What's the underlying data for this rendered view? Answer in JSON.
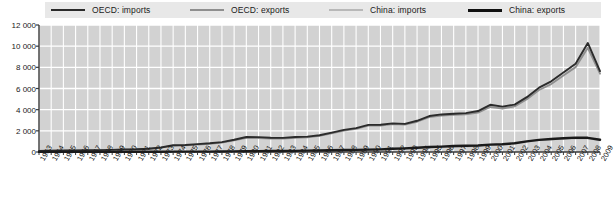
{
  "legend": {
    "position": "top",
    "items": [
      {
        "label": "OECD: imports",
        "color": "#2b2b2b",
        "width": 1.9,
        "icon": "line-swatch"
      },
      {
        "label": "OECD: exports",
        "color": "#8f8f8f",
        "width": 1.9,
        "icon": "line-swatch"
      },
      {
        "label": "China: imports",
        "color": "#b0b0b0",
        "width": 1.6,
        "icon": "line-swatch"
      },
      {
        "label": "China: exports",
        "color": "#1a1a1a",
        "width": 2.4,
        "icon": "line-swatch"
      }
    ]
  },
  "axes": {
    "y_ticks": [
      "0",
      "2 000",
      "4 000",
      "6 000",
      "8 000",
      "10 000",
      "12 000"
    ],
    "y_values": [
      0,
      2000,
      4000,
      6000,
      8000,
      10000,
      12000
    ],
    "x_ticks": [
      "1963",
      "1964",
      "1965",
      "1966",
      "1967",
      "1968",
      "1969",
      "1970",
      "1971",
      "1972",
      "1973",
      "1974",
      "1975",
      "1976",
      "1977",
      "1978",
      "1979",
      "1980",
      "1981",
      "1982",
      "1983",
      "1984",
      "1985",
      "1986",
      "1987",
      "1988",
      "1989",
      "1990",
      "1991",
      "1992",
      "1993",
      "1994",
      "1995",
      "1996",
      "1997",
      "1998",
      "1999",
      "2000",
      "2001",
      "2002",
      "2003",
      "2004",
      "2005",
      "2006",
      "2007",
      "2008",
      "2009"
    ]
  },
  "colors": {
    "plot_background": "#d2d2d2",
    "gridline": "#ffffff",
    "axis_line": "#3a3a3a",
    "legend_background": "#e8e8e8",
    "page_background": "#ffffff",
    "text": "#1a1a1a"
  },
  "chart_data": {
    "type": "line",
    "title": "",
    "subtitle": "",
    "xlabel": "",
    "ylabel": "",
    "xlim": [
      1963,
      2009
    ],
    "ylim": [
      0,
      12000
    ],
    "grid": true,
    "legend_position": "top",
    "x": [
      1963,
      1964,
      1965,
      1966,
      1967,
      1968,
      1969,
      1970,
      1971,
      1972,
      1973,
      1974,
      1975,
      1976,
      1977,
      1978,
      1979,
      1980,
      1981,
      1982,
      1983,
      1984,
      1985,
      1986,
      1987,
      1988,
      1989,
      1990,
      1991,
      1992,
      1993,
      1994,
      1995,
      1996,
      1997,
      1998,
      1999,
      2000,
      2001,
      2002,
      2003,
      2004,
      2005,
      2006,
      2007,
      2008,
      2009
    ],
    "series": [
      {
        "name": "OECD: imports",
        "color": "#2b2b2b",
        "values": [
          110,
          120,
          135,
          150,
          160,
          180,
          205,
          235,
          260,
          310,
          430,
          640,
          660,
          740,
          820,
          930,
          1160,
          1420,
          1410,
          1340,
          1330,
          1420,
          1450,
          1580,
          1830,
          2090,
          2260,
          2560,
          2570,
          2700,
          2660,
          2950,
          3400,
          3550,
          3620,
          3670,
          3870,
          4460,
          4290,
          4480,
          5180,
          6080,
          6680,
          7520,
          8340,
          10300,
          7650
        ]
      },
      {
        "name": "OECD: exports",
        "color": "#8f8f8f",
        "values": [
          105,
          115,
          130,
          145,
          155,
          175,
          200,
          228,
          252,
          300,
          415,
          600,
          630,
          700,
          780,
          890,
          1100,
          1330,
          1320,
          1270,
          1260,
          1330,
          1380,
          1520,
          1760,
          2020,
          2190,
          2490,
          2500,
          2630,
          2590,
          2860,
          3300,
          3450,
          3510,
          3560,
          3730,
          4260,
          4110,
          4310,
          4990,
          5860,
          6420,
          7230,
          8020,
          9840,
          7400
        ]
      },
      {
        "name": "China: imports",
        "color": "#b0b0b0",
        "values": [
          12,
          13,
          14,
          15,
          16,
          16,
          17,
          19,
          20,
          22,
          31,
          41,
          42,
          44,
          45,
          54,
          78,
          95,
          102,
          110,
          115,
          150,
          295,
          300,
          310,
          380,
          400,
          390,
          420,
          510,
          610,
          810,
          950,
          1020,
          1080,
          1100,
          1300,
          1700,
          1770,
          2050,
          2750,
          3400,
          4000,
          4670,
          5420,
          8800,
          8500
        ]
      },
      {
        "name": "China: exports",
        "color": "#1a1a1a",
        "values": [
          14,
          15,
          16,
          17,
          18,
          19,
          20,
          21,
          23,
          25,
          35,
          47,
          50,
          52,
          54,
          59,
          77,
          94,
          110,
          120,
          125,
          140,
          185,
          215,
          250,
          310,
          350,
          400,
          470,
          600,
          700,
          900,
          1150,
          1250,
          1450,
          1500,
          1600,
          1900,
          1980,
          2330,
          3080,
          4000,
          4870,
          6050,
          7520,
          10100,
          9500
        ]
      }
    ],
    "note": "China series are plotted at approximately 1/8 scale relative to OECD in the source figure; rendered values peak near 1200 on the 0-12000 axis."
  },
  "render_series": {
    "oecd_imports": [
      110,
      120,
      135,
      150,
      160,
      180,
      205,
      235,
      260,
      310,
      430,
      640,
      660,
      740,
      820,
      930,
      1160,
      1420,
      1410,
      1340,
      1330,
      1420,
      1450,
      1580,
      1830,
      2090,
      2260,
      2560,
      2570,
      2700,
      2660,
      2950,
      3400,
      3550,
      3620,
      3670,
      3870,
      4460,
      4290,
      4480,
      5180,
      6080,
      6680,
      7520,
      8340,
      10300,
      7650
    ],
    "oecd_exports": [
      105,
      115,
      130,
      145,
      155,
      175,
      200,
      228,
      252,
      300,
      415,
      600,
      630,
      700,
      780,
      890,
      1100,
      1330,
      1320,
      1270,
      1260,
      1330,
      1380,
      1520,
      1760,
      2020,
      2190,
      2490,
      2500,
      2630,
      2590,
      2860,
      3300,
      3450,
      3510,
      3560,
      3730,
      4260,
      4110,
      4310,
      4990,
      5860,
      6420,
      7230,
      8020,
      9840,
      7400
    ],
    "china_imports": [
      8,
      9,
      10,
      11,
      11,
      12,
      13,
      14,
      15,
      17,
      23,
      30,
      31,
      33,
      34,
      40,
      58,
      70,
      76,
      82,
      86,
      110,
      150,
      155,
      160,
      190,
      200,
      195,
      210,
      255,
      300,
      380,
      430,
      460,
      480,
      490,
      560,
      700,
      720,
      820,
      1000,
      1120,
      1180,
      1230,
      1280,
      1270,
      1090
    ],
    "china_exports": [
      10,
      11,
      12,
      12,
      13,
      14,
      15,
      16,
      17,
      19,
      26,
      35,
      37,
      38,
      40,
      44,
      57,
      70,
      82,
      89,
      93,
      104,
      130,
      145,
      160,
      185,
      200,
      220,
      250,
      300,
      340,
      400,
      470,
      510,
      570,
      590,
      620,
      700,
      730,
      830,
      1000,
      1150,
      1230,
      1300,
      1360,
      1340,
      1160
    ]
  }
}
